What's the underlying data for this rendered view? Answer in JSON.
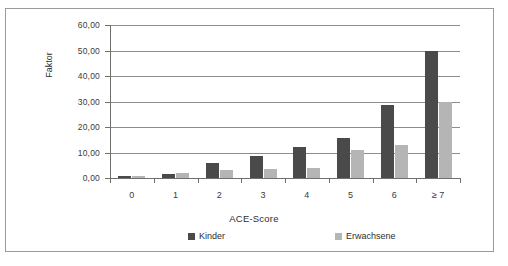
{
  "chart_data": {
    "type": "bar",
    "title": "",
    "xlabel": "ACE-Score",
    "ylabel": "Faktor",
    "categories": [
      "0",
      "1",
      "2",
      "3",
      "4",
      "5",
      "6",
      "≥ 7"
    ],
    "series": [
      {
        "name": "Kinder",
        "color": "#4a4a4a",
        "values": [
          0.8,
          1.5,
          6.0,
          8.5,
          12.0,
          15.5,
          28.5,
          50.0
        ]
      },
      {
        "name": "Erwachsene",
        "color": "#b5b5b5",
        "values": [
          0.8,
          2.0,
          3.0,
          3.5,
          4.0,
          11.0,
          13.0,
          30.0
        ]
      }
    ],
    "ylim": [
      0,
      60
    ],
    "ytick_values": [
      0,
      10,
      20,
      30,
      40,
      50,
      60
    ],
    "ytick_labels": [
      "0,00",
      "10,00",
      "20,00",
      "30,00",
      "40,00",
      "50,00",
      "60,00"
    ],
    "grid": true,
    "legend_position": "bottom"
  },
  "figure": {
    "caption": ""
  }
}
